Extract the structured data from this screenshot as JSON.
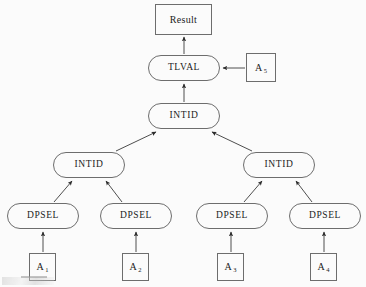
{
  "diagram": {
    "background_color": "#fbfbfb",
    "stroke_color": "#6d6d6d",
    "edge_color": "#3a3a3a",
    "text_color": "#1b1b1b",
    "nodes": [
      {
        "id": "result",
        "label": "Result",
        "shape": "rect",
        "x": 155,
        "y": 4,
        "w": 57,
        "h": 31
      },
      {
        "id": "tlval",
        "label": "TLVAL",
        "shape": "round",
        "x": 148,
        "y": 55,
        "w": 72,
        "h": 26
      },
      {
        "id": "a5",
        "label": "A",
        "sub": "5",
        "shape": "rect",
        "x": 246,
        "y": 53,
        "w": 30,
        "h": 29
      },
      {
        "id": "intid0",
        "label": "INTID",
        "shape": "round",
        "x": 148,
        "y": 103,
        "w": 72,
        "h": 26
      },
      {
        "id": "intid1",
        "label": "INTID",
        "shape": "round",
        "x": 53,
        "y": 152,
        "w": 72,
        "h": 26
      },
      {
        "id": "intid2",
        "label": "INTID",
        "shape": "round",
        "x": 243,
        "y": 152,
        "w": 72,
        "h": 26
      },
      {
        "id": "dpsel1",
        "label": "DPSEL",
        "shape": "round",
        "x": 7,
        "y": 203,
        "w": 72,
        "h": 26
      },
      {
        "id": "dpsel2",
        "label": "DPSEL",
        "shape": "round",
        "x": 100,
        "y": 203,
        "w": 72,
        "h": 26
      },
      {
        "id": "dpsel3",
        "label": "DPSEL",
        "shape": "round",
        "x": 196,
        "y": 203,
        "w": 72,
        "h": 26
      },
      {
        "id": "dpsel4",
        "label": "DPSEL",
        "shape": "round",
        "x": 289,
        "y": 203,
        "w": 72,
        "h": 26
      },
      {
        "id": "a1",
        "label": "A",
        "sub": "1",
        "shape": "rect",
        "x": 29,
        "y": 253,
        "w": 27,
        "h": 28
      },
      {
        "id": "a2",
        "label": "A",
        "sub": "2",
        "shape": "rect",
        "x": 122,
        "y": 253,
        "w": 27,
        "h": 28
      },
      {
        "id": "a3",
        "label": "A",
        "sub": "3",
        "shape": "rect",
        "x": 217,
        "y": 253,
        "w": 27,
        "h": 28
      },
      {
        "id": "a4",
        "label": "A",
        "sub": "4",
        "shape": "rect",
        "x": 310,
        "y": 253,
        "w": 27,
        "h": 28
      }
    ],
    "edges": [
      {
        "from": "tlval",
        "to": "result",
        "x1": 184,
        "y1": 54,
        "x2": 184,
        "y2": 37,
        "direction": "up"
      },
      {
        "from": "a5",
        "to": "tlval",
        "x1": 245,
        "y1": 68,
        "x2": 223,
        "y2": 68,
        "direction": "left"
      },
      {
        "from": "intid0",
        "to": "tlval",
        "x1": 184,
        "y1": 102,
        "x2": 184,
        "y2": 84,
        "direction": "up"
      },
      {
        "from": "intid1",
        "to": "intid0",
        "x1": 116,
        "y1": 151,
        "x2": 156,
        "y2": 132,
        "direction": "up-right"
      },
      {
        "from": "intid2",
        "to": "intid0",
        "x1": 252,
        "y1": 151,
        "x2": 212,
        "y2": 132,
        "direction": "up-left"
      },
      {
        "from": "dpsel1",
        "to": "intid1",
        "x1": 54,
        "y1": 202,
        "x2": 72,
        "y2": 181,
        "direction": "up-right"
      },
      {
        "from": "dpsel2",
        "to": "intid1",
        "x1": 122,
        "y1": 202,
        "x2": 106,
        "y2": 181,
        "direction": "up-left"
      },
      {
        "from": "dpsel3",
        "to": "intid2",
        "x1": 244,
        "y1": 202,
        "x2": 262,
        "y2": 181,
        "direction": "up-right"
      },
      {
        "from": "dpsel4",
        "to": "intid2",
        "x1": 312,
        "y1": 202,
        "x2": 296,
        "y2": 181,
        "direction": "up-left"
      },
      {
        "from": "a1",
        "to": "dpsel1",
        "x1": 43,
        "y1": 252,
        "x2": 43,
        "y2": 232,
        "direction": "up"
      },
      {
        "from": "a2",
        "to": "dpsel2",
        "x1": 136,
        "y1": 252,
        "x2": 136,
        "y2": 232,
        "direction": "up"
      },
      {
        "from": "a3",
        "to": "dpsel3",
        "x1": 231,
        "y1": 252,
        "x2": 231,
        "y2": 232,
        "direction": "up"
      },
      {
        "from": "a4",
        "to": "dpsel4",
        "x1": 324,
        "y1": 252,
        "x2": 324,
        "y2": 232,
        "direction": "up"
      }
    ]
  }
}
